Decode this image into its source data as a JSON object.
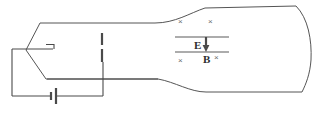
{
  "figure": {
    "name": "cathode-ray-tube-diagram",
    "title": "",
    "background_color": "#ffffff",
    "line_color": "#555555",
    "labels": {
      "electric_field": "E",
      "magnetic_field": "B"
    },
    "field_marks": {
      "glyph": "×",
      "meaning": "field-into-page",
      "count": 4,
      "positions": [
        {
          "x": 181,
          "y": 21
        },
        {
          "x": 211,
          "y": 21
        },
        {
          "x": 181,
          "y": 60
        },
        {
          "x": 224,
          "y": 57
        }
      ]
    },
    "components": [
      {
        "name": "battery",
        "label": ""
      },
      {
        "name": "cathode",
        "label": ""
      },
      {
        "name": "anode-plate",
        "label": ""
      },
      {
        "name": "deflecting-plates",
        "label": "E"
      },
      {
        "name": "magnetic-field-region",
        "label": "B"
      },
      {
        "name": "tube-envelope",
        "label": ""
      },
      {
        "name": "screen",
        "label": ""
      }
    ],
    "arrow": {
      "name": "electric-field-arrow",
      "direction": "down"
    }
  }
}
